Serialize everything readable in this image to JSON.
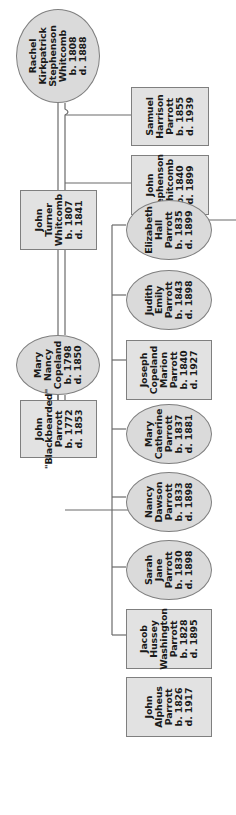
{
  "orientation": "rotated 90 degrees counterclockwise",
  "colors": {
    "node_fill": "#e2e2e2",
    "node_border": "#7f7f7f",
    "line": "#6b6b6b",
    "text": "#1a1a1a"
  },
  "legend_shapes": {
    "rectangle": "male",
    "ellipse": "female"
  },
  "generation1": {
    "rachel": {
      "lines": [
        "Rachel",
        "Kirkpatrick",
        "Stephenson",
        "Whitcomb",
        "b. 1808",
        "d. 1888"
      ],
      "shape": "ellipse"
    },
    "john_turner": {
      "lines": [
        "John",
        "Turner",
        "Whitcomb",
        "b. 1807",
        "d. 1841"
      ],
      "shape": "rectangle"
    },
    "mary_nancy": {
      "lines": [
        "Mary",
        "Nancy",
        "Copeland",
        "b. 1798",
        "d. 1850"
      ],
      "shape": "ellipse"
    },
    "john_blackbearded": {
      "lines": [
        "John",
        "\"Blackbearded\"",
        "Parrott",
        "b. 1772",
        "d. 1853"
      ],
      "shape": "rectangle"
    }
  },
  "generation2_whitcomb": [
    {
      "lines": [
        "Samuel",
        "Harrison",
        "Parrott",
        "b. 1855",
        "d. 1939"
      ],
      "shape": "rectangle"
    },
    {
      "lines": [
        "John",
        "Stephenson",
        "Whitcomb",
        "b. 1840",
        "d. 1899"
      ],
      "shape": "rectangle"
    }
  ],
  "generation2_parrott": [
    {
      "lines": [
        "Elizabeth",
        "Hall",
        "Parrott",
        "b. 1835",
        "d. 1899"
      ],
      "shape": "ellipse"
    },
    {
      "lines": [
        "Judith",
        "Emily",
        "Parrott",
        "b. 1843",
        "d. 1898"
      ],
      "shape": "ellipse"
    },
    {
      "lines": [
        "Joseph",
        "Copeland",
        "Marion",
        "Parrott",
        "b. 1840",
        "d. 1927"
      ],
      "shape": "rectangle"
    },
    {
      "lines": [
        "Mary",
        "Catherine",
        "Parrott",
        "b. 1837",
        "d. 1881"
      ],
      "shape": "ellipse"
    },
    {
      "lines": [
        "Nancy",
        "Dawson",
        "Parrott",
        "b. 1833",
        "d. 1898"
      ],
      "shape": "ellipse"
    },
    {
      "lines": [
        "Sarah",
        "Jane",
        "Parrott",
        "b. 1830",
        "d. 1898"
      ],
      "shape": "ellipse"
    },
    {
      "lines": [
        "Jacob",
        "Hussey",
        "Washington",
        "Parrott",
        "b. 1828",
        "d. 1895"
      ],
      "shape": "rectangle"
    },
    {
      "lines": [
        "John",
        "Alpheus",
        "Parrott",
        "b. 1826",
        "d. 1917"
      ],
      "shape": "rectangle"
    }
  ]
}
